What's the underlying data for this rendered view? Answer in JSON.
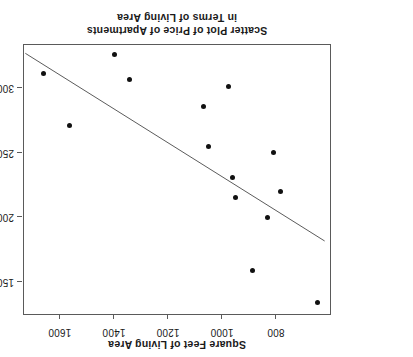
{
  "chart_data": {
    "type": "scatter",
    "title": "Scatter Plot of Price of Apartments in Terms of Living Area",
    "title_line1": "Scatter Plot of Price of Apartments",
    "title_line2": "in Terms of Living Area",
    "xlabel": "Square Feet of Living Area",
    "ylabel": "Price (Canadian dollars)",
    "orientation": "rotated-180",
    "grid": false,
    "legend": "none",
    "xlim": [
      600,
      1740
    ],
    "ylim": [
      125000,
      335000
    ],
    "xticks": [
      800,
      1000,
      1200,
      1400,
      1600
    ],
    "xticklabels": [
      "800",
      "1000",
      "1200",
      "1400",
      "1600"
    ],
    "yticks": [
      150000,
      200000,
      250000,
      300000
    ],
    "yticklabels": [
      "150,000",
      "200,000",
      "250,000",
      "300,000"
    ],
    "marker_color": "#111111",
    "line_color": "#5a5a5a",
    "frame_color": "#5a5a5a",
    "points": [
      {
        "x": 648,
        "y": 134000
      },
      {
        "x": 887,
        "y": 159000
      },
      {
        "x": 833,
        "y": 200000
      },
      {
        "x": 948,
        "y": 215000
      },
      {
        "x": 782,
        "y": 220000
      },
      {
        "x": 962,
        "y": 231000
      },
      {
        "x": 810,
        "y": 250000
      },
      {
        "x": 1049,
        "y": 255000
      },
      {
        "x": 1067,
        "y": 286000
      },
      {
        "x": 977,
        "y": 301000
      },
      {
        "x": 1564,
        "y": 271000
      },
      {
        "x": 1343,
        "y": 307000
      },
      {
        "x": 1662,
        "y": 311000
      },
      {
        "x": 1397,
        "y": 326000
      }
    ],
    "trendline": {
      "label": "least-squares fit",
      "x_start": 1735,
      "y_start": 328500,
      "x_end": 620,
      "y_end": 182000
    }
  }
}
